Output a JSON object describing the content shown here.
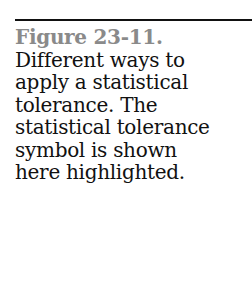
{
  "caption": {
    "label": "Figure 23-11.",
    "lines": [
      "Different ways to",
      "apply a statistical",
      "tolerance. The",
      "statistical tolerance",
      "symbol is shown",
      "here highlighted."
    ]
  },
  "colors": {
    "label": "#8a8a8a",
    "text": "#111111",
    "rule": "#111111"
  }
}
